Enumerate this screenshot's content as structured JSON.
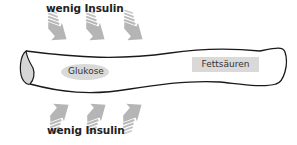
{
  "labels": {
    "top": "wenig Insulin",
    "bottom": "wenig Insulin",
    "glucose": "Glukose",
    "fatty_acids": "Fettsäuren"
  },
  "colors": {
    "arrow": "#b8b8b8",
    "glucose_fill": "#d9d9d9",
    "fatty_acids_fill": "#d9d9d9",
    "tube_stroke": "#1a1a1a",
    "tube_end_fill": "#d6d6d6"
  },
  "arrows": {
    "top": [
      {
        "direction": "down-right"
      },
      {
        "direction": "down-right"
      },
      {
        "direction": "down-right"
      }
    ],
    "bottom": [
      {
        "direction": "up-right"
      },
      {
        "direction": "up-right"
      },
      {
        "direction": "up-right"
      }
    ]
  }
}
